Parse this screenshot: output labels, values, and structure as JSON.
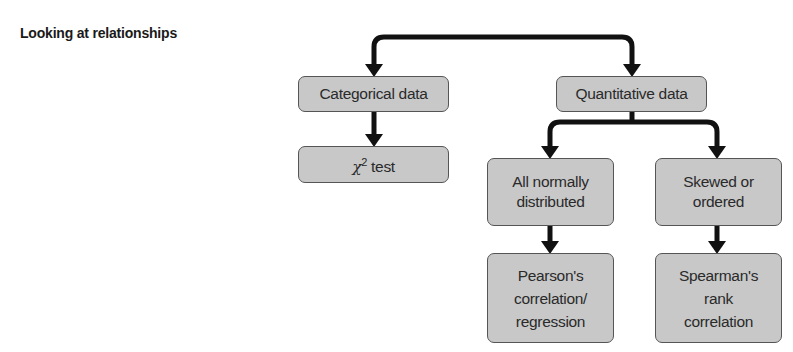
{
  "title": "Looking at relationships",
  "nodes": {
    "categorical": {
      "label": "Categorical data"
    },
    "quantitative": {
      "label": "Quantitative data"
    },
    "chi_square": {
      "symbol": "χ",
      "superscript": "2",
      "label": " test"
    },
    "normal": {
      "line1": "All normally",
      "line2": "distributed"
    },
    "skewed": {
      "line1": "Skewed or",
      "line2": "ordered"
    },
    "pearson": {
      "line1": "Pearson's",
      "line2": "correlation/",
      "line3": "regression"
    },
    "spearman": {
      "line1": "Spearman's",
      "line2": "rank",
      "line3": "correlation"
    }
  },
  "edges": [
    {
      "from": "root",
      "to": "categorical"
    },
    {
      "from": "root",
      "to": "quantitative"
    },
    {
      "from": "categorical",
      "to": "chi_square"
    },
    {
      "from": "quantitative",
      "to": "normal"
    },
    {
      "from": "quantitative",
      "to": "skewed"
    },
    {
      "from": "normal",
      "to": "pearson"
    },
    {
      "from": "skewed",
      "to": "spearman"
    }
  ],
  "colors": {
    "box_fill": "#c8c8c8",
    "box_border": "#555555",
    "arrow": "#111111"
  }
}
